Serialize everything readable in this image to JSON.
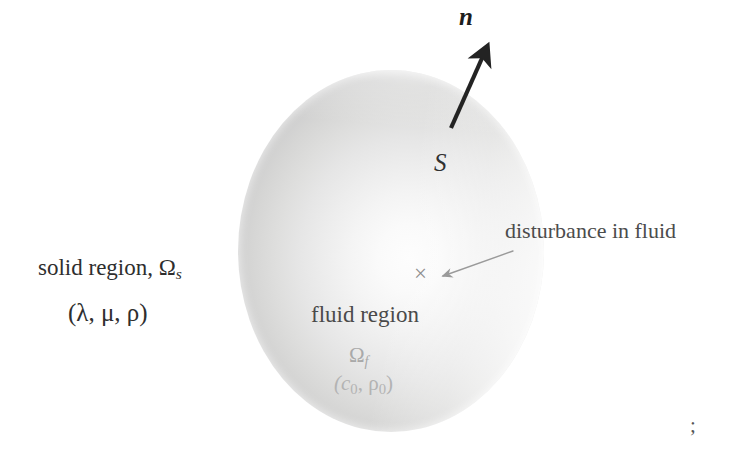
{
  "figure": {
    "background_color": "#ffffff"
  },
  "labels": {
    "solid_region": "solid region, Ω",
    "solid_region_subscript": "s",
    "solid_region_params": "(λ, μ, ρ)",
    "fluid_region": "fluid region",
    "fluid_region_omega": "Ω",
    "fluid_region_omega_subscript": "f",
    "fluid_region_params_open": "(c",
    "fluid_region_params_sub1": "0",
    "fluid_region_params_mid": ", ρ",
    "fluid_region_params_sub2": "0",
    "fluid_region_params_close": ")",
    "surface": "S",
    "normal_vector": "n",
    "disturbance": "disturbance in fluid",
    "disturbance_marker": "×",
    "corner_mark": ";"
  },
  "geometry": {
    "sphere": {
      "center_x": 391,
      "center_y": 251,
      "radius_x": 153,
      "radius_y": 181,
      "fill_light": "#fdfdfd",
      "fill_dark": "#c4c4c4"
    },
    "normal_arrow": {
      "tail_x": 451,
      "tail_y": 128,
      "tip_x": 489,
      "tip_y": 44,
      "color": "#232323",
      "stroke_width": 4.2
    },
    "disturbance_arrow": {
      "tail_x": 513,
      "tail_y": 251,
      "tip_x": 439,
      "tip_y": 277,
      "color": "#9a9a9a",
      "stroke_width": 1.4
    },
    "disturbance_point": {
      "x": 423,
      "y": 275
    }
  },
  "colors": {
    "ink": "#2b2b2b",
    "faded_ink": "#b3b3b3",
    "arrow_dark": "#232323",
    "arrow_light": "#9a9a9a",
    "paper": "#ffffff"
  }
}
